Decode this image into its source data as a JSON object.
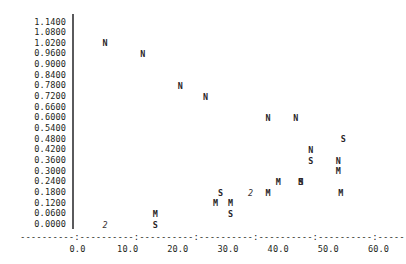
{
  "chart_data": {
    "type": "scatter",
    "title": "",
    "subtitle": "",
    "xlabel": "",
    "ylabel": "",
    "xlim": [
      0.0,
      60.0
    ],
    "ylim": [
      0.0,
      1.14
    ],
    "grid": false,
    "legend_position": "none",
    "marker_style": "character-glyph",
    "x_ticks": [
      "0.0",
      "10.0",
      "20.0",
      "30.0",
      "40.0",
      "50.0",
      "60.0"
    ],
    "x_tick_values": [
      0.0,
      10.0,
      20.0,
      30.0,
      40.0,
      50.0,
      60.0
    ],
    "y_ticks": [
      "1.1400",
      "1.0800",
      "1.0200",
      "0.9600",
      "0.9000",
      "0.8400",
      "0.7800",
      "0.7200",
      "0.6600",
      "0.6000",
      "0.5400",
      "0.4800",
      "0.4200",
      "0.3600",
      "0.3000",
      "0.2400",
      "0.1800",
      "0.1200",
      "0.0600",
      "0.0000"
    ],
    "y_tick_values": [
      1.14,
      1.08,
      1.02,
      0.96,
      0.9,
      0.84,
      0.78,
      0.72,
      0.66,
      0.6,
      0.54,
      0.48,
      0.42,
      0.36,
      0.3,
      0.24,
      0.18,
      0.12,
      0.06,
      0.0
    ],
    "axis_line_glyph": "----------:----------:----------:----------:----------:----------:----------:",
    "series": [
      {
        "name": "N",
        "symbol": "N",
        "points": [
          {
            "x": 5.5,
            "y": 1.02
          },
          {
            "x": 13.0,
            "y": 0.96
          },
          {
            "x": 20.5,
            "y": 0.78
          },
          {
            "x": 25.5,
            "y": 0.72
          },
          {
            "x": 38.0,
            "y": 0.6
          },
          {
            "x": 43.5,
            "y": 0.6
          },
          {
            "x": 46.5,
            "y": 0.42
          },
          {
            "x": 52.0,
            "y": 0.36
          },
          {
            "x": 44.5,
            "y": 0.24
          },
          {
            "x": 33.5,
            "y": 0.12
          }
        ]
      },
      {
        "name": "S",
        "symbol": "S",
        "points": [
          {
            "x": 53.0,
            "y": 0.48
          },
          {
            "x": 46.5,
            "y": 0.36
          },
          {
            "x": 44.5,
            "y": 0.18
          },
          {
            "x": 28.5,
            "y": 0.18
          },
          {
            "x": 30.5,
            "y": 0.06
          },
          {
            "x": 15.5,
            "y": 0.0
          }
        ]
      },
      {
        "name": "M",
        "symbol": "M",
        "points": [
          {
            "x": 52.0,
            "y": 0.3
          },
          {
            "x": 40.0,
            "y": 0.24
          },
          {
            "x": 44.5,
            "y": 0.24
          },
          {
            "x": 52.5,
            "y": 0.18
          },
          {
            "x": 27.5,
            "y": 0.12
          },
          {
            "x": 30.5,
            "y": 0.12
          },
          {
            "x": 15.5,
            "y": 0.06
          }
        ]
      },
      {
        "name": "overlapping-count-2",
        "symbol": "2",
        "points": [
          {
            "x": 5.5,
            "y": 0.0
          },
          {
            "x": 34.5,
            "y": 0.18
          }
        ]
      }
    ],
    "markers": [
      {
        "symbol": "N",
        "x": 5.5,
        "y": 1.02
      },
      {
        "symbol": "N",
        "x": 13.0,
        "y": 0.96
      },
      {
        "symbol": "N",
        "x": 20.5,
        "y": 0.78
      },
      {
        "symbol": "N",
        "x": 25.5,
        "y": 0.72
      },
      {
        "symbol": "N",
        "x": 38.0,
        "y": 0.6
      },
      {
        "symbol": "N",
        "x": 43.5,
        "y": 0.6
      },
      {
        "symbol": "S",
        "x": 53.0,
        "y": 0.48
      },
      {
        "symbol": "N",
        "x": 46.5,
        "y": 0.42
      },
      {
        "symbol": "S",
        "x": 46.5,
        "y": 0.36
      },
      {
        "symbol": "N",
        "x": 52.0,
        "y": 0.36
      },
      {
        "symbol": "M",
        "x": 52.0,
        "y": 0.3
      },
      {
        "symbol": "S",
        "x": 44.5,
        "y": 0.24
      },
      {
        "symbol": "M",
        "x": 40.0,
        "y": 0.24
      },
      {
        "symbol": "M",
        "x": 44.5,
        "y": 0.24
      },
      {
        "symbol": "S",
        "x": 28.5,
        "y": 0.18
      },
      {
        "symbol": "2",
        "x": 34.5,
        "y": 0.18
      },
      {
        "symbol": "M",
        "x": 38.0,
        "y": 0.18
      },
      {
        "symbol": "M",
        "x": 52.5,
        "y": 0.18
      },
      {
        "symbol": "M",
        "x": 27.5,
        "y": 0.12
      },
      {
        "symbol": "M",
        "x": 30.5,
        "y": 0.12
      },
      {
        "symbol": "M",
        "x": 15.5,
        "y": 0.06
      },
      {
        "symbol": "S",
        "x": 30.5,
        "y": 0.06
      },
      {
        "symbol": "2",
        "x": 5.5,
        "y": 0.0
      },
      {
        "symbol": "S",
        "x": 15.5,
        "y": 0.0
      }
    ]
  },
  "colors": {
    "background": "#ffffff",
    "text": "#231f20",
    "axis": "#5a5a5c",
    "marker": "#2a2628"
  }
}
